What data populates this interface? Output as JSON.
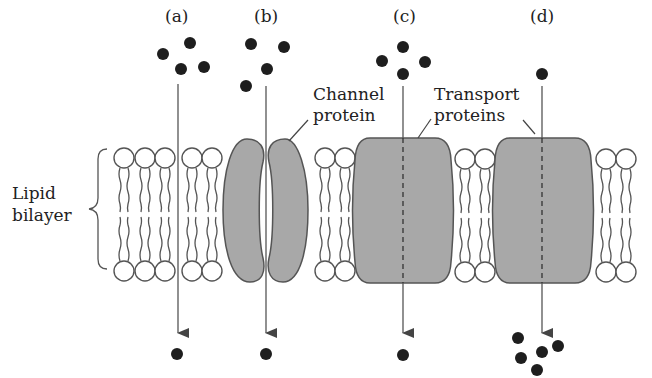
{
  "diagram": {
    "panels": [
      {
        "id": "a",
        "label": "(a)",
        "pathway": "simple diffusion through lipid bilayer",
        "molecules_above": 4,
        "molecules_below": 1
      },
      {
        "id": "b",
        "label": "(b)",
        "pathway": "channel protein",
        "molecules_above": 4,
        "molecules_below": 1
      },
      {
        "id": "c",
        "label": "(c)",
        "pathway": "transport protein",
        "molecules_above": 4,
        "molecules_below": 1
      },
      {
        "id": "d",
        "label": "(d)",
        "pathway": "transport protein",
        "molecules_above": 1,
        "molecules_below": 5
      }
    ],
    "labels": {
      "lipid_line1": "Lipid",
      "lipid_line2": "bilayer",
      "channel_line1": "Channel",
      "channel_line2": "protein",
      "transport_line1": "Transport",
      "transport_line2": "proteins"
    },
    "colors": {
      "protein_fill": "#a8a8a8",
      "molecule": "#1e1e1e",
      "outline": "#555555"
    }
  }
}
